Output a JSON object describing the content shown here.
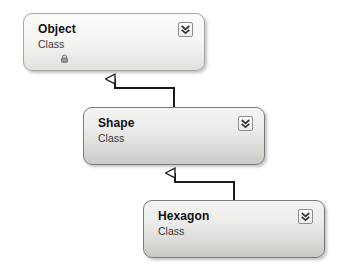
{
  "diagram": {
    "type": "uml-class-diagram",
    "background_color": "#ffffff",
    "nodes": [
      {
        "id": "object",
        "title": "Object",
        "stereotype": "Class",
        "has_collapse_button": true,
        "collapse_icon": "double-chevron-down-icon",
        "has_lock_glyph": true,
        "lock_icon": "lock-icon",
        "style": "pale",
        "x": 23,
        "y": 13,
        "width": 182,
        "height": 58
      },
      {
        "id": "shape",
        "title": "Shape",
        "stereotype": "Class",
        "has_collapse_button": true,
        "collapse_icon": "double-chevron-down-icon",
        "has_lock_glyph": false,
        "style": "normal",
        "x": 83,
        "y": 107,
        "width": 182,
        "height": 58
      },
      {
        "id": "hexagon",
        "title": "Hexagon",
        "stereotype": "Class",
        "has_collapse_button": true,
        "collapse_icon": "double-chevron-down-icon",
        "has_lock_glyph": false,
        "style": "normal",
        "x": 143,
        "y": 200,
        "width": 182,
        "height": 58
      }
    ],
    "connectors": [
      {
        "id": "shape-inherits-object",
        "kind": "generalization",
        "arrowhead": "hollow-triangle",
        "from": "shape",
        "to": "object",
        "line_color": "#1a1a1a",
        "path": "M 174 107 L 174 88 L 115 88 L 115 78"
      },
      {
        "id": "hexagon-inherits-shape",
        "kind": "generalization",
        "arrowhead": "hollow-triangle",
        "from": "hexagon",
        "to": "shape",
        "line_color": "#1a1a1a",
        "path": "M 234 200 L 234 182 L 175 182 L 175 172"
      }
    ]
  }
}
